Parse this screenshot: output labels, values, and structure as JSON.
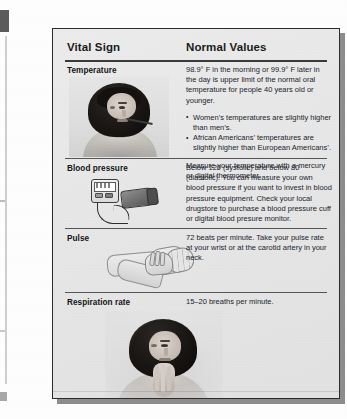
{
  "table": {
    "headers": {
      "vital_sign": "Vital Sign",
      "normal_values": "Normal Values"
    },
    "rows": [
      {
        "label": "Temperature",
        "figure": "photo-woman-with-oral-thermometer",
        "paragraphs": [
          "98.9° F in the morning or 99.9° F later in the day is upper limit of the normal oral temperature for people 40 years old or younger."
        ],
        "bullets": [
          "Women’s temperatures are slightly higher than men’s.",
          "African Americans’ temperatures are slightly higher than European Americans’."
        ],
        "closing": "Measure your temperature with a mercury or digital thermometer."
      },
      {
        "label": "Blood pressure",
        "figure": "illustration-digital-blood-pressure-monitor-with-cuff",
        "paragraphs": [
          "Below 120 (systolic) and below 80 (diastolic). You can measure your own blood pressure if you want to invest in blood pressure equipment. Check your local drugstore to purchase a blood pressure cuff or digital blood presure monitor."
        ],
        "bullets": [],
        "closing": ""
      },
      {
        "label": "Pulse",
        "figure": "illustration-hand-taking-pulse-at-wrist",
        "paragraphs": [
          "72 beats per minute. Take your pulse rate at your wrist or at the carotid artery in your neck."
        ],
        "bullets": [],
        "closing": ""
      },
      {
        "label": "Respiration rate",
        "figure": "photo-woman-with-fingers-at-neck",
        "paragraphs": [
          "15–20 breaths per minute."
        ],
        "bullets": [],
        "closing": ""
      }
    ]
  },
  "colors": {
    "card_background": "#e9e9e9",
    "card_border": "#2c2c2c",
    "text": "#20242c",
    "heading": "#1b1b1b",
    "rule": "#555555",
    "page_background": "#fefefe"
  }
}
